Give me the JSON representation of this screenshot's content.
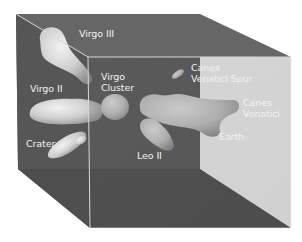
{
  "diagram": {
    "colors": {
      "background": "#ffffff",
      "back_face": "#5a5a5a",
      "left_side": "#555555",
      "top_side": "#6e6e6e",
      "floor": "#4f4f4f",
      "front_face": "#505050",
      "edge": "#d8d8d8",
      "blob": "#dcdcdc",
      "label": "#f2f2f2"
    },
    "labels": {
      "virgo_iii": "Virgo III",
      "virgo_ii": "Virgo II",
      "virgo_cluster": "Virgo\nCluster",
      "canes_venatici_spur": "Canes\nVenatici Spur",
      "canes_venatici": "Canes\nVenatici",
      "crater": "Crater",
      "leo_ii": "Leo II",
      "earth": "Earth"
    }
  }
}
